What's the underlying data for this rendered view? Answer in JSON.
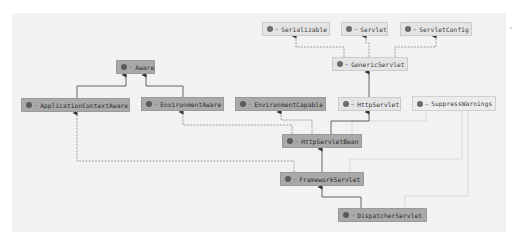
{
  "diagram": {
    "colors": {
      "canvas": "#f2f2f2",
      "class_node": "#a9a9a9",
      "interface_node": "#e4e4e4",
      "solid_edge": "#555555",
      "dashed_edge": "#8a8a8a",
      "annotation_edge": "#cfcfcf"
    },
    "nodes": [
      {
        "id": "serializable",
        "label": "Serializable",
        "kind": "interface",
        "icon": "interface-icon"
      },
      {
        "id": "servlet",
        "label": "Servlet",
        "kind": "interface",
        "icon": "interface-icon"
      },
      {
        "id": "servletconfig",
        "label": "ServletConfig",
        "kind": "interface",
        "icon": "interface-icon"
      },
      {
        "id": "genericservlet",
        "label": "GenericServlet",
        "kind": "abstract-class",
        "icon": "class-icon"
      },
      {
        "id": "aware",
        "label": "Aware",
        "kind": "interface",
        "icon": "interface-icon"
      },
      {
        "id": "applicationcontextaware",
        "label": "ApplicationContextAware",
        "kind": "interface",
        "icon": "interface-icon"
      },
      {
        "id": "environmentaware",
        "label": "EnvironmentAware",
        "kind": "interface",
        "icon": "interface-icon"
      },
      {
        "id": "environmentcapable",
        "label": "EnvironmentCapable",
        "kind": "interface",
        "icon": "interface-icon"
      },
      {
        "id": "httpservlet",
        "label": "HttpServlet",
        "kind": "abstract-class",
        "icon": "class-icon"
      },
      {
        "id": "suppresswarnings",
        "label": "SuppressWarnings",
        "kind": "annotation",
        "icon": "annotation-icon"
      },
      {
        "id": "httpservletbean",
        "label": "HttpServletBean",
        "kind": "abstract-class",
        "icon": "class-icon"
      },
      {
        "id": "frameworkservlet",
        "label": "FrameworkServlet",
        "kind": "abstract-class",
        "icon": "class-icon"
      },
      {
        "id": "dispatcherservlet",
        "label": "DispatcherServlet",
        "kind": "class",
        "icon": "class-icon"
      }
    ],
    "edges": [
      {
        "from": "genericservlet",
        "to": "serializable",
        "type": "implements"
      },
      {
        "from": "genericservlet",
        "to": "servlet",
        "type": "implements"
      },
      {
        "from": "genericservlet",
        "to": "servletconfig",
        "type": "implements"
      },
      {
        "from": "httpservlet",
        "to": "genericservlet",
        "type": "extends"
      },
      {
        "from": "applicationcontextaware",
        "to": "aware",
        "type": "extends"
      },
      {
        "from": "environmentaware",
        "to": "aware",
        "type": "extends"
      },
      {
        "from": "httpservletbean",
        "to": "httpservlet",
        "type": "extends"
      },
      {
        "from": "httpservletbean",
        "to": "environmentcapable",
        "type": "implements"
      },
      {
        "from": "httpservletbean",
        "to": "environmentaware",
        "type": "implements"
      },
      {
        "from": "frameworkservlet",
        "to": "httpservletbean",
        "type": "extends"
      },
      {
        "from": "frameworkservlet",
        "to": "applicationcontextaware",
        "type": "implements"
      },
      {
        "from": "dispatcherservlet",
        "to": "frameworkservlet",
        "type": "extends"
      },
      {
        "from": "httpservletbean",
        "to": "suppresswarnings",
        "type": "annotated"
      },
      {
        "from": "frameworkservlet",
        "to": "suppresswarnings",
        "type": "annotated"
      },
      {
        "from": "dispatcherservlet",
        "to": "suppresswarnings",
        "type": "annotated"
      }
    ]
  }
}
